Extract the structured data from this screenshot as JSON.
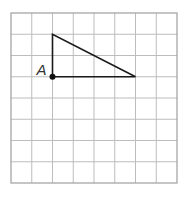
{
  "grid": {
    "x": 11,
    "y": 13,
    "width": 166,
    "height": 170,
    "cols": 8,
    "rows": 8,
    "line_color": "#bdbdbd",
    "border_color": "#9e9e9e"
  },
  "triangle": {
    "vertices_grid": [
      [
        2,
        1
      ],
      [
        2,
        3
      ],
      [
        6,
        3
      ]
    ],
    "stroke": "#1a1a1a"
  },
  "point": {
    "label": "A",
    "grid": [
      2,
      3
    ],
    "color": "#111111"
  }
}
